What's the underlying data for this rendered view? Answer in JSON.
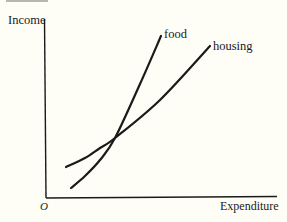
{
  "chart_data": {
    "type": "line",
    "title": "",
    "xlabel": "Expenditure",
    "ylabel": "Income",
    "origin_label": "O",
    "grid": false,
    "legend": "inline labels at curve ends",
    "axis_ticks": "none (qualitative diagram)",
    "series": [
      {
        "name": "food",
        "description": "steeper curve, starts lower, crosses housing and ends higher",
        "points_px": [
          [
            71,
            188
          ],
          [
            85,
            176
          ],
          [
            100,
            160
          ],
          [
            115,
            138
          ],
          [
            140,
            84
          ],
          [
            161,
            36
          ]
        ]
      },
      {
        "name": "housing",
        "description": "flatter curve, starts higher, crossed by food",
        "points_px": [
          [
            66,
            167
          ],
          [
            85,
            158
          ],
          [
            100,
            148
          ],
          [
            115,
            138
          ],
          [
            160,
            100
          ],
          [
            210,
            46
          ]
        ]
      }
    ],
    "intersection_px": [
      115,
      138
    ]
  },
  "labels": {
    "ylabel": "Income",
    "xlabel": "Expenditure",
    "origin": "O",
    "food": "food",
    "housing": "housing"
  },
  "colors": {
    "background": "#fefef7",
    "ink": "#1a1a1a"
  }
}
